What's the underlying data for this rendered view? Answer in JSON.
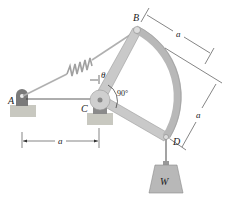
{
  "diagram": {
    "type": "mechanism",
    "points": {
      "A": {
        "label": "A",
        "x": 21,
        "y": 97
      },
      "B": {
        "label": "B",
        "x": 137,
        "y": 30
      },
      "C": {
        "label": "C",
        "x": 100,
        "y": 100
      },
      "D": {
        "label": "D",
        "x": 166,
        "y": 137
      }
    },
    "labels": {
      "point_a": "A",
      "point_b": "B",
      "point_c": "C",
      "point_d": "D",
      "theta": "θ",
      "angle_90": "90°",
      "weight": "W",
      "dim_ac": "a",
      "dim_bd_top": "a",
      "dim_right": "a"
    },
    "colors": {
      "member_fill": "#c9c9c9",
      "member_stroke": "#9a9a9a",
      "support_fill": "#b5b5b5",
      "ground_fill": "#c8c8c0",
      "weight_fill": "#b8b8b8",
      "line": "#333333",
      "spring": "#a8a8a8"
    }
  }
}
